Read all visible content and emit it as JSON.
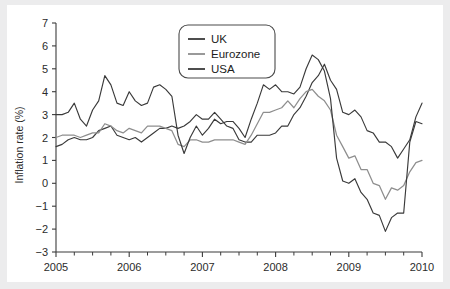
{
  "figure": {
    "background": "#ffffff",
    "page_background": "#ececed"
  },
  "chart_data": {
    "type": "line",
    "title": "",
    "subtitle": "",
    "xlabel": "",
    "ylabel": "Inflation rate (%)",
    "xlim": [
      2005,
      2010
    ],
    "ylim": [
      -3,
      7
    ],
    "grid": false,
    "legend_position": "top-center",
    "x_tick_labels": [
      "2005",
      "2006",
      "2007",
      "2008",
      "2009",
      "2010"
    ],
    "x_tick_values": [
      2005,
      2006,
      2007,
      2008,
      2009,
      2010
    ],
    "x_minor_ticks_per_interval": 3,
    "y_tick_labels": [
      "7",
      "6",
      "5",
      "4",
      "3",
      "2",
      "1",
      "0",
      "−1",
      "−2",
      "−3"
    ],
    "y_tick_values": [
      7,
      6,
      5,
      4,
      3,
      2,
      1,
      0,
      -1,
      -2,
      -3
    ],
    "colors": {
      "uk": "#3a3a3a",
      "eurozone": "#8e8e8e",
      "usa": "#3a3a3a",
      "axis": "#3b3b3b",
      "text": "#2b2b2b"
    },
    "series": [
      {
        "name": "UK",
        "color": "#3a3a3a",
        "x": [
          2005.0,
          2005.083,
          2005.167,
          2005.25,
          2005.333,
          2005.417,
          2005.5,
          2005.583,
          2005.667,
          2005.75,
          2005.833,
          2005.917,
          2006.0,
          2006.083,
          2006.167,
          2006.25,
          2006.333,
          2006.417,
          2006.5,
          2006.583,
          2006.667,
          2006.75,
          2006.833,
          2006.917,
          2007.0,
          2007.083,
          2007.167,
          2007.25,
          2007.333,
          2007.417,
          2007.5,
          2007.583,
          2007.667,
          2007.75,
          2007.833,
          2007.917,
          2008.0,
          2008.083,
          2008.167,
          2008.25,
          2008.333,
          2008.417,
          2008.5,
          2008.583,
          2008.667,
          2008.75,
          2008.833,
          2008.917,
          2009.0,
          2009.083,
          2009.167,
          2009.25,
          2009.333,
          2009.417,
          2009.5,
          2009.583,
          2009.667,
          2009.75,
          2009.833,
          2009.917,
          2010.0
        ],
        "y": [
          1.6,
          1.7,
          1.9,
          2.0,
          1.9,
          1.9,
          2.0,
          2.3,
          2.4,
          2.5,
          2.1,
          2.0,
          1.9,
          2.0,
          1.8,
          2.0,
          2.2,
          2.4,
          2.4,
          2.5,
          2.4,
          2.5,
          2.7,
          3.0,
          2.8,
          2.8,
          3.1,
          2.8,
          2.5,
          2.4,
          1.9,
          1.8,
          1.8,
          2.1,
          2.1,
          2.1,
          2.2,
          2.5,
          2.5,
          3.0,
          3.3,
          3.8,
          4.4,
          4.7,
          5.2,
          4.5,
          4.1,
          3.1,
          3.0,
          3.2,
          2.9,
          2.3,
          2.2,
          1.8,
          1.8,
          1.6,
          1.1,
          1.5,
          1.9,
          2.9,
          3.5
        ]
      },
      {
        "name": "Eurozone",
        "color": "#8e8e8e",
        "x": [
          2005.0,
          2005.083,
          2005.167,
          2005.25,
          2005.333,
          2005.417,
          2005.5,
          2005.583,
          2005.667,
          2005.75,
          2005.833,
          2005.917,
          2006.0,
          2006.083,
          2006.167,
          2006.25,
          2006.333,
          2006.417,
          2006.5,
          2006.583,
          2006.667,
          2006.75,
          2006.833,
          2006.917,
          2007.0,
          2007.083,
          2007.167,
          2007.25,
          2007.333,
          2007.417,
          2007.5,
          2007.583,
          2007.667,
          2007.75,
          2007.833,
          2007.917,
          2008.0,
          2008.083,
          2008.167,
          2008.25,
          2008.333,
          2008.417,
          2008.5,
          2008.583,
          2008.667,
          2008.75,
          2008.833,
          2008.917,
          2009.0,
          2009.083,
          2009.167,
          2009.25,
          2009.333,
          2009.417,
          2009.5,
          2009.583,
          2009.667,
          2009.75,
          2009.833,
          2009.917,
          2010.0
        ],
        "y": [
          2.0,
          2.1,
          2.1,
          2.1,
          2.0,
          2.1,
          2.2,
          2.2,
          2.6,
          2.5,
          2.3,
          2.2,
          2.4,
          2.3,
          2.2,
          2.5,
          2.5,
          2.5,
          2.4,
          2.3,
          1.7,
          1.6,
          1.9,
          1.9,
          1.8,
          1.8,
          1.9,
          1.9,
          1.9,
          1.9,
          1.8,
          1.7,
          2.1,
          2.6,
          3.1,
          3.1,
          3.2,
          3.3,
          3.6,
          3.3,
          3.7,
          4.0,
          4.1,
          3.8,
          3.6,
          3.2,
          2.1,
          1.6,
          1.1,
          1.2,
          0.6,
          0.6,
          0.0,
          -0.1,
          -0.7,
          -0.2,
          -0.3,
          -0.1,
          0.5,
          0.9,
          1.0
        ]
      },
      {
        "name": "USA",
        "color": "#3a3a3a",
        "x": [
          2005.0,
          2005.083,
          2005.167,
          2005.25,
          2005.333,
          2005.417,
          2005.5,
          2005.583,
          2005.667,
          2005.75,
          2005.833,
          2005.917,
          2006.0,
          2006.083,
          2006.167,
          2006.25,
          2006.333,
          2006.417,
          2006.5,
          2006.583,
          2006.667,
          2006.75,
          2006.833,
          2006.917,
          2007.0,
          2007.083,
          2007.167,
          2007.25,
          2007.333,
          2007.417,
          2007.5,
          2007.583,
          2007.667,
          2007.75,
          2007.833,
          2007.917,
          2008.0,
          2008.083,
          2008.167,
          2008.25,
          2008.333,
          2008.417,
          2008.5,
          2008.583,
          2008.667,
          2008.75,
          2008.833,
          2008.917,
          2009.0,
          2009.083,
          2009.167,
          2009.25,
          2009.333,
          2009.417,
          2009.5,
          2009.583,
          2009.667,
          2009.75,
          2009.833,
          2009.917,
          2010.0
        ],
        "y": [
          3.0,
          3.0,
          3.1,
          3.5,
          2.8,
          2.5,
          3.2,
          3.6,
          4.7,
          4.3,
          3.5,
          3.4,
          4.0,
          3.6,
          3.4,
          3.5,
          4.2,
          4.3,
          4.1,
          3.8,
          2.1,
          1.3,
          2.0,
          2.5,
          2.1,
          2.4,
          2.8,
          2.6,
          2.7,
          2.7,
          2.4,
          2.0,
          2.8,
          3.5,
          4.3,
          4.1,
          4.3,
          4.0,
          4.0,
          3.9,
          4.2,
          5.0,
          5.6,
          5.4,
          4.9,
          3.7,
          1.1,
          0.1,
          0.0,
          0.2,
          -0.4,
          -0.7,
          -1.3,
          -1.4,
          -2.1,
          -1.5,
          -1.3,
          -1.3,
          1.8,
          2.7,
          2.6
        ]
      }
    ]
  },
  "legend": {
    "items": [
      {
        "label": "UK",
        "color": "#3a3a3a"
      },
      {
        "label": "Eurozone",
        "color": "#8e8e8e"
      },
      {
        "label": "USA",
        "color": "#3a3a3a"
      }
    ]
  }
}
